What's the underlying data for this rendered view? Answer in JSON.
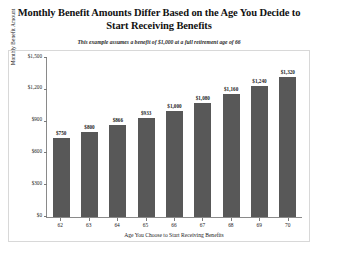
{
  "figure": {
    "title": "Monthly Benefit Amounts Differ Based on the Age You Decide to Start Receiving Benefits",
    "subtitle": "This example assumes a benefit of $1,000 at a full retirement age of 66",
    "source_note": "Source: http://www.ssa.gov/pubs/10147.html#a0=1",
    "bar_color": "#585858",
    "frame_color": "#d8d8d8",
    "axis_color": "#8a8a8a"
  },
  "chart_data": {
    "type": "bar",
    "title": "Monthly Benefit Amounts Differ Based on the Age You Decide to Start Receiving Benefits",
    "subtitle": "This example assumes a benefit of $1,000 at a full retirement age of 66",
    "xlabel": "Age You Choose to Start Receiving Benefits",
    "ylabel": "Monthly Benefit Amount",
    "categories": [
      "62",
      "63",
      "64",
      "65",
      "66",
      "67",
      "68",
      "69",
      "70"
    ],
    "values": [
      750,
      800,
      866,
      933,
      1000,
      1080,
      1160,
      1240,
      1320
    ],
    "value_labels": [
      "$750",
      "$800",
      "$866",
      "$933",
      "$1,000",
      "$1,080",
      "$1,160",
      "$1,240",
      "$1,320"
    ],
    "ylim": [
      0,
      1500
    ],
    "yticks": [
      0,
      300,
      600,
      900,
      1200,
      1500
    ],
    "ytick_labels": [
      "$0",
      "$300",
      "$600",
      "$900",
      "$1,200",
      "$1,500"
    ],
    "grid": false,
    "legend": "none"
  }
}
